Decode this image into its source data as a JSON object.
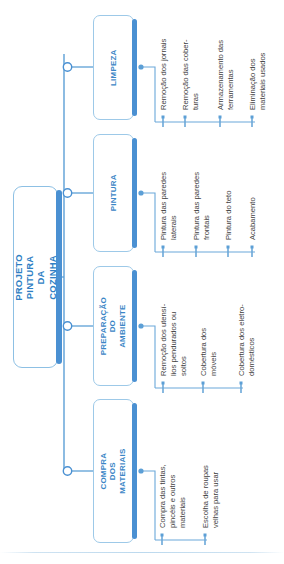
{
  "diagram": {
    "type": "tree-orgchart",
    "orientation": "rotated-90-ccw",
    "title": "PROJETO\nPINTURA DA COZINHA",
    "root_label": "PROJETO\nPINTURA DA COZINHA",
    "colors": {
      "node_border": "#9dc9e8",
      "node_accent": "#4a90d2",
      "root_text": "#2f7fc4",
      "branch_text": "#3b86c6",
      "connector": "#5c9fd6",
      "leaf_text": "#3f3f3f",
      "background": "#ffffff"
    },
    "branches": [
      {
        "id": "compra-dos-materiais",
        "label": "COMPRA DOS\nMATERIAIS",
        "items": [
          "Compra das tintas,\npincéis e outros\nmateriais",
          "Escolha de roupas\nvelhas para usar"
        ]
      },
      {
        "id": "preparacao-do-ambiente",
        "label": "PREPARAÇÃO DO\nAMBIENTE",
        "items": [
          "Remoção dos utensí-\nlios pendurados ou\nsoltos",
          "Cobertura dos\nmóveis",
          "Cobertura dos eletro-\ndomésticos"
        ]
      },
      {
        "id": "pintura",
        "label": "PINTURA",
        "items": [
          "Pintura das paredes\nlaterais",
          "Pintura das paredes\nfrontais",
          "Pintura do teto",
          "Acabamento"
        ]
      },
      {
        "id": "limpeza",
        "label": "LIMPEZA",
        "items": [
          "Remoção dos jornais",
          "Remoção das cober-\nturas",
          "Armazenamento das\nferramentas",
          "Eliminação dos\nmateriais usados"
        ]
      }
    ]
  }
}
